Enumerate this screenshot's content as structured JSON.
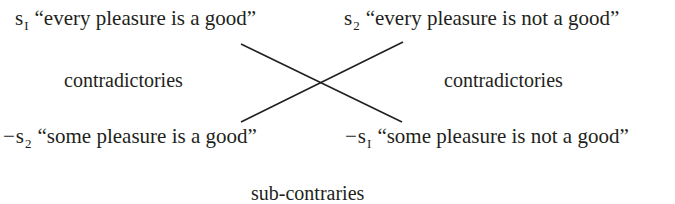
{
  "diagram": {
    "type": "square-of-opposition (partial)",
    "nodes": {
      "top_left": {
        "symbol": "s",
        "subscript": "I",
        "negation": "",
        "text": "“every pleasure is a good”"
      },
      "top_right": {
        "symbol": "s",
        "subscript": "2",
        "negation": "",
        "text": "“every pleasure is not a good”"
      },
      "bottom_left": {
        "symbol": "s",
        "subscript": "2",
        "negation": "−",
        "text": "“some pleasure is a good”"
      },
      "bottom_right": {
        "symbol": "s",
        "subscript": "I",
        "negation": "−",
        "text": "“some pleasure is not a good”"
      }
    },
    "relations": {
      "left": "contradictories",
      "right": "contradictories",
      "bottom": "sub-contraries"
    },
    "edges": [
      {
        "from": "top_left",
        "to": "bottom_right",
        "label": "contradictories"
      },
      {
        "from": "top_right",
        "to": "bottom_left",
        "label": "contradictories"
      }
    ],
    "colors": {
      "text": "#231f20",
      "line": "#231f20",
      "background": "#ffffff"
    }
  }
}
